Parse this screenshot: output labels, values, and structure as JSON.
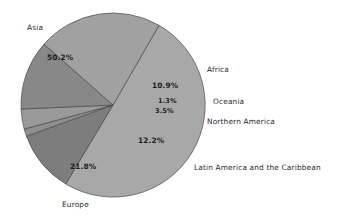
{
  "chart_data": {
    "type": "pie",
    "title": "",
    "subtitle": "",
    "xlabel": "",
    "ylabel": "",
    "legend_position": "outside-labels",
    "grid": false,
    "units": "percent",
    "categories": [
      "Asia",
      "Africa",
      "Oceania",
      "Northern America",
      "Latin America and the Caribbean",
      "Europe"
    ],
    "values": [
      50.2,
      10.9,
      1.3,
      3.5,
      12.2,
      21.8
    ],
    "slices": [
      {
        "label": "Asia",
        "value": 50.2,
        "value_text": "50.2%",
        "color": "#a8a8a8",
        "label_x": 27,
        "label_y": 24,
        "pct_x": 47,
        "pct_y": 54
      },
      {
        "label": "Africa",
        "value": 10.9,
        "value_text": "10.9%",
        "color": "#7d7d7d",
        "label_x": 207,
        "label_y": 66,
        "pct_x": 152,
        "pct_y": 82
      },
      {
        "label": "Oceania",
        "value": 1.3,
        "value_text": "1.3%",
        "color": "#8f8f8f",
        "label_x": 213,
        "label_y": 98,
        "pct_x": 158,
        "pct_y": 98
      },
      {
        "label": "Northern America",
        "value": 3.5,
        "value_text": "3.5%",
        "color": "#9a9a9a",
        "label_x": 207,
        "label_y": 118,
        "pct_x": 155,
        "pct_y": 108
      },
      {
        "label": "Latin America and the Caribbean",
        "value": 12.2,
        "value_text": "12.2%",
        "color": "#888888",
        "label_x": 194,
        "label_y": 164,
        "pct_x": 138,
        "pct_y": 137
      },
      {
        "label": "Europe",
        "value": 21.8,
        "value_text": "21.8%",
        "color": "#a1a1a1",
        "label_x": 62,
        "label_y": 201,
        "pct_x": 70,
        "pct_y": 163
      }
    ],
    "geometry": {
      "center_x": 113,
      "center_y": 105,
      "radius": 92,
      "start_angle_deg": -60
    },
    "style": {
      "background": "#ffffff",
      "outline": "#4a4a4a",
      "text": "#2b2b2b"
    }
  }
}
